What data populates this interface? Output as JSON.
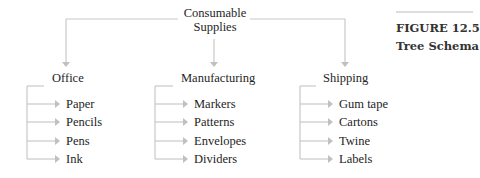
{
  "diagram": {
    "root": {
      "line1": "Consumable",
      "line2": "Supplies"
    },
    "branches": [
      {
        "label": "Office",
        "children": [
          "Paper",
          "Pencils",
          "Pens",
          "Ink"
        ]
      },
      {
        "label": "Manufacturing",
        "children": [
          "Markers",
          "Patterns",
          "Envelopes",
          "Dividers"
        ]
      },
      {
        "label": "Shipping",
        "children": [
          "Gum tape",
          "Cartons",
          "Twine",
          "Labels"
        ]
      }
    ],
    "line_color": "#c8c8c8"
  },
  "figure": {
    "number": "FIGURE 12.5",
    "title": "Tree Schema"
  }
}
